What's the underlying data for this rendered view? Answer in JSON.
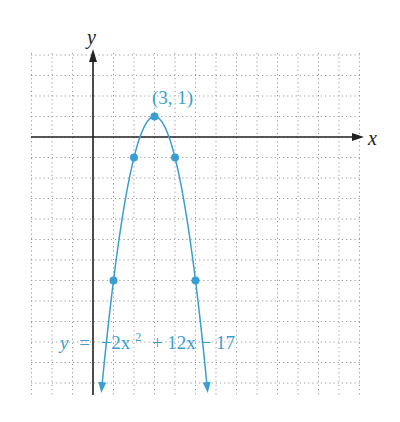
{
  "chart_data": {
    "type": "line",
    "title": "",
    "xlabel": "x",
    "ylabel": "y",
    "equation": "y = −2x² + 12x − 17",
    "equation_parts": {
      "lhs": "y",
      "eq": "=",
      "t1": "−2x",
      "sup": "2",
      "t2": "+ 12x − 17"
    },
    "vertex_label": "(3, 1)",
    "xlim": [
      -3,
      13
    ],
    "ylim": [
      -12.5,
      4
    ],
    "grid": true,
    "grid_style": "dotted",
    "series": [
      {
        "name": "y = −2x² + 12x − 17",
        "color": "#3a9fd0",
        "points": [
          {
            "x": 1,
            "y": -7
          },
          {
            "x": 2,
            "y": -1
          },
          {
            "x": 3,
            "y": 1
          },
          {
            "x": 4,
            "y": -1
          },
          {
            "x": 5,
            "y": -7
          }
        ]
      }
    ],
    "annotations": [
      {
        "text": "(3, 1)",
        "x": 3,
        "y": 1
      }
    ]
  },
  "colors": {
    "curve": "#3a9fd0",
    "axis": "#222222",
    "grid": "#9a9a9a"
  }
}
